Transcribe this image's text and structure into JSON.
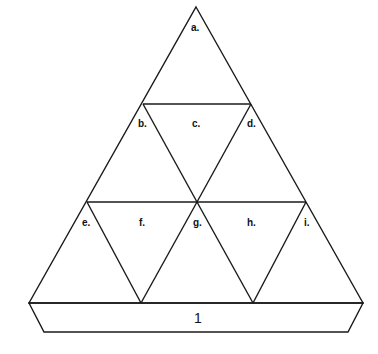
{
  "diagram": {
    "type": "triangle-net",
    "stroke_color": "#1a1a1a",
    "background": "#ffffff",
    "labels": {
      "a": "a.",
      "b": "b.",
      "c": "c.",
      "d": "d.",
      "e": "e.",
      "f": "f.",
      "g": "g.",
      "h": "h.",
      "i": "i."
    },
    "tab_label": "1"
  }
}
